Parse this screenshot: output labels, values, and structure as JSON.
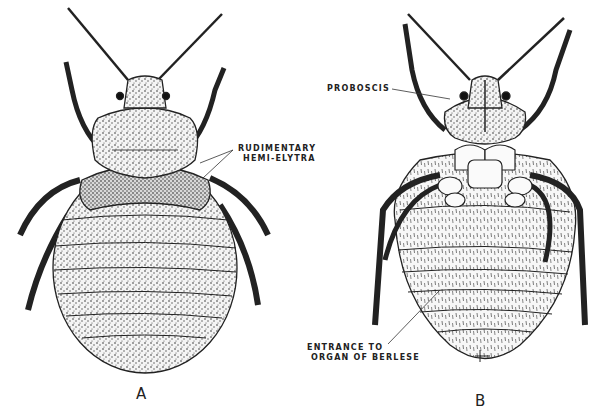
{
  "figure": {
    "panels": [
      {
        "id": "A",
        "letter": "A",
        "view": "dorsal",
        "labels": [
          {
            "line1": "RUDIMENTARY",
            "line2": "HEMI-ELYTRA"
          }
        ]
      },
      {
        "id": "B",
        "letter": "B",
        "view": "ventral",
        "labels": [
          {
            "line1": "PROBOSCIS"
          },
          {
            "line1": "ENTRANCE TO",
            "line2": "ORGAN OF BERLESE"
          }
        ]
      }
    ]
  }
}
